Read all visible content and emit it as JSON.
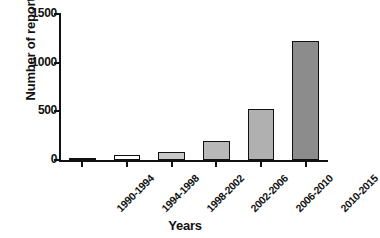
{
  "chart_data": {
    "type": "bar",
    "title": "",
    "subtitle": "",
    "xlabel": "Years",
    "ylabel": "Number of reports",
    "categories": [
      "1990-1994",
      "1994-1998",
      "1998-2002",
      "2002-2006",
      "2006-2010",
      "2010-2015"
    ],
    "values": [
      25,
      50,
      85,
      200,
      525,
      1220
    ],
    "series": [
      {
        "name": "Number of reports",
        "values": [
          25,
          50,
          85,
          200,
          525,
          1220
        ]
      }
    ],
    "bar_colors": [
      "#1a1a1a",
      "#ffffff",
      "#c9c9c9",
      "#b8b8b8",
      "#b0b0b0",
      "#8c8c8c"
    ],
    "bar_edge_color": "#111111",
    "ylim": [
      0,
      1500
    ],
    "yticks": [
      0,
      500,
      1000,
      1500
    ],
    "ytick_labels": [
      "0",
      "500",
      "1000",
      "1500"
    ],
    "grid": false,
    "legend": null,
    "legend_position": "none",
    "axis_style": "left-and-bottom-spines",
    "xtick_label_rotation": -45
  }
}
